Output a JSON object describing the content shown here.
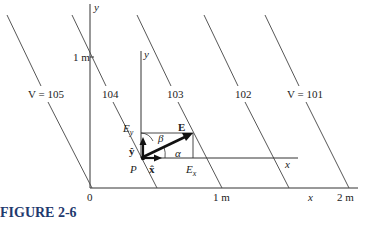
{
  "figure": {
    "caption": "FIGURE 2-6"
  },
  "axes": {
    "outer_y_label": "y",
    "outer_x_label": "x",
    "origin_label": "0",
    "tick_y_1m": "1 m",
    "tick_x_1m": "1 m",
    "tick_x_2m": "2 m",
    "inner_y_label": "y",
    "inner_x_label": "x"
  },
  "equipotentials": [
    {
      "label": "V = 105"
    },
    {
      "label": "104"
    },
    {
      "label": "103"
    },
    {
      "label": "102"
    },
    {
      "label": "V = 101"
    }
  ],
  "vector": {
    "E_label": "E",
    "Ex_label": "E",
    "Ex_sub": "x",
    "Ey_label": "E",
    "Ey_sub": "y",
    "alpha": "α",
    "beta": "β",
    "point": "P",
    "x_hat": "x̂",
    "y_hat": "ŷ"
  },
  "colors": {
    "line": "#333333",
    "caption": "#1f3a6e"
  }
}
